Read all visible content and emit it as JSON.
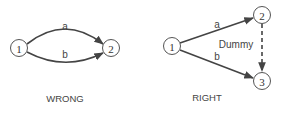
{
  "wrong": {
    "caption": "WRONG",
    "nodes": [
      {
        "id": "1",
        "label": "1"
      },
      {
        "id": "2",
        "label": "2"
      }
    ],
    "edges": [
      {
        "from": "1",
        "to": "2",
        "label": "a"
      },
      {
        "from": "1",
        "to": "2",
        "label": "b"
      }
    ]
  },
  "right": {
    "caption": "RIGHT",
    "nodes": [
      {
        "id": "1",
        "label": "1"
      },
      {
        "id": "2",
        "label": "2"
      },
      {
        "id": "3",
        "label": "3"
      }
    ],
    "edges": [
      {
        "from": "1",
        "to": "2",
        "label": "a"
      },
      {
        "from": "1",
        "to": "3",
        "label": "b"
      },
      {
        "from": "2",
        "to": "3",
        "label": "Dummy",
        "style": "dashed"
      }
    ]
  },
  "colors": {
    "stroke": "#444444",
    "text": "#333333",
    "background": "#ffffff"
  }
}
